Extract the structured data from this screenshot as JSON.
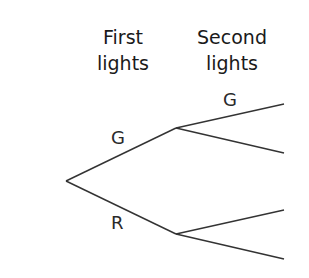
{
  "headers": {
    "first": [
      "First",
      "lights"
    ],
    "second": [
      "Second",
      "lights"
    ]
  },
  "tree": {
    "branch_labels": {
      "first_top": "G",
      "first_bottom": "R",
      "second_top_top": "G"
    },
    "line_color": "#333333"
  }
}
